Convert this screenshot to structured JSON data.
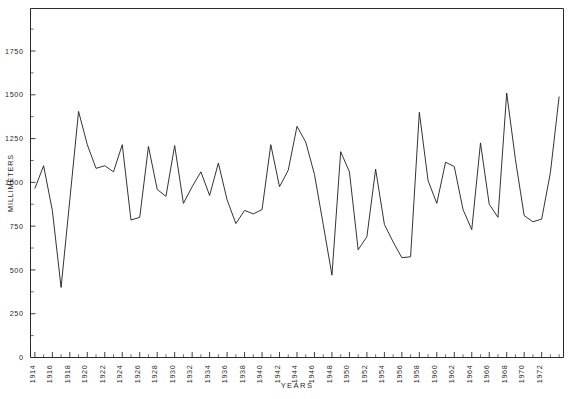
{
  "chart_data": {
    "type": "line",
    "title": "",
    "xlabel": "YEARS",
    "ylabel": "MILLIMETERS",
    "xlim": [
      1913.5,
      1974.5
    ],
    "ylim": [
      0,
      1900
    ],
    "grid": false,
    "legend": null,
    "ytick_labels": [
      "0",
      "250",
      "500",
      "750",
      "1000",
      "1250",
      "1500",
      "1750"
    ],
    "ytick_values": [
      0,
      250,
      500,
      750,
      1000,
      1250,
      1500,
      1750
    ],
    "ytick_minor_step": 125,
    "xtick_labels": [
      "1914",
      "1916",
      "1918",
      "1920",
      "1922",
      "1924",
      "1926",
      "1928",
      "1930",
      "1932",
      "1934",
      "1936",
      "1938",
      "1940",
      "1942",
      "1944",
      "1946",
      "1948",
      "1950",
      "1952",
      "1954",
      "1956",
      "1958",
      "1960",
      "1962",
      "1964",
      "1966",
      "1968",
      "1970",
      "1972"
    ],
    "xtick_values": [
      1914,
      1916,
      1918,
      1920,
      1922,
      1924,
      1926,
      1928,
      1930,
      1932,
      1934,
      1936,
      1938,
      1940,
      1942,
      1944,
      1946,
      1948,
      1950,
      1952,
      1954,
      1956,
      1958,
      1960,
      1962,
      1964,
      1966,
      1968,
      1970,
      1972
    ],
    "xtick_minor_step": 1,
    "series": [
      {
        "name": "annual-rainfall",
        "color": "#1c1c1c",
        "x": [
          1914,
          1915,
          1916,
          1917,
          1918,
          1919,
          1920,
          1921,
          1922,
          1923,
          1924,
          1925,
          1926,
          1927,
          1928,
          1929,
          1930,
          1931,
          1932,
          1933,
          1934,
          1935,
          1936,
          1937,
          1938,
          1939,
          1940,
          1941,
          1942,
          1943,
          1944,
          1945,
          1946,
          1947,
          1948,
          1949,
          1950,
          1951,
          1952,
          1953,
          1954,
          1955,
          1956,
          1957,
          1958,
          1959,
          1960,
          1961,
          1962,
          1963,
          1964,
          1965,
          1966,
          1967,
          1968,
          1969,
          1970,
          1971,
          1972,
          1973,
          1974
        ],
        "y": [
          965,
          1095,
          840,
          400,
          900,
          1405,
          1215,
          1080,
          1095,
          1060,
          1215,
          785,
          800,
          1205,
          960,
          920,
          1210,
          880,
          975,
          1060,
          925,
          1110,
          900,
          765,
          840,
          820,
          845,
          1215,
          975,
          1070,
          1320,
          1230,
          1045,
          760,
          470,
          1175,
          1060,
          615,
          690,
          1075,
          760,
          660,
          570,
          575,
          1400,
          1010,
          880,
          1115,
          1090,
          845,
          730,
          1225,
          875,
          800,
          1510,
          1130,
          810,
          775,
          790,
          1055,
          1490
        ]
      }
    ]
  },
  "axis": {
    "y_label_text": "MILLIMETERS",
    "x_label_text": "YEARS"
  }
}
